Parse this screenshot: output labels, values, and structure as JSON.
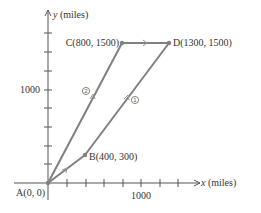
{
  "diagram": {
    "axes": {
      "x_label_var": "x",
      "x_label_unit": " (miles)",
      "y_label_var": "y",
      "y_label_unit": " (miles)",
      "x_tick_label": "1000",
      "y_tick_label": "1000",
      "tick_spacing_miles": 200
    },
    "points": [
      {
        "name": "A",
        "label": "A(0, 0)",
        "x": 0,
        "y": 0
      },
      {
        "name": "B",
        "label": "B(400, 300)",
        "x": 400,
        "y": 300
      },
      {
        "name": "C",
        "label": "C(800, 1500)",
        "x": 800,
        "y": 1500
      },
      {
        "name": "D",
        "label": "D(1300, 1500)",
        "x": 1300,
        "y": 1500
      }
    ],
    "routes": [
      {
        "id": "1",
        "marker": "1",
        "path": [
          "A",
          "B",
          "D"
        ]
      },
      {
        "id": "2",
        "marker": "2",
        "path": [
          "A",
          "C",
          "D"
        ]
      }
    ],
    "colors": {
      "route_line": "#808080",
      "axis": "#555555",
      "text": "#333333"
    }
  }
}
